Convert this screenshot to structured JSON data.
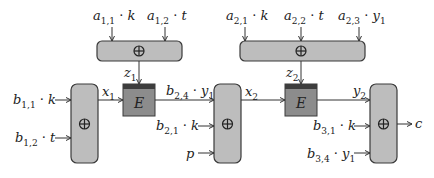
{
  "diagram": {
    "type": "block-diagram",
    "colors": {
      "xor_box": "#bdbdbd",
      "enc_box": "#8c8c8c",
      "enc_top": "#3d3d3d",
      "stroke": "#3a3a3a"
    },
    "top_xor_1": {
      "inputs": [
        {
          "coef": "a",
          "sub": "1,1",
          "var": "k"
        },
        {
          "coef": "a",
          "sub": "1,2",
          "var": "t"
        }
      ],
      "output": {
        "name": "z",
        "sub": "1"
      }
    },
    "top_xor_2": {
      "inputs": [
        {
          "coef": "a",
          "sub": "2,1",
          "var": "k"
        },
        {
          "coef": "a",
          "sub": "2,2",
          "var": "t"
        },
        {
          "coef": "a",
          "sub": "2,3",
          "var": "y",
          "varsub": "1"
        }
      ],
      "output": {
        "name": "z",
        "sub": "2"
      }
    },
    "xor_1": {
      "inputs": [
        {
          "coef": "b",
          "sub": "1,1",
          "var": "k"
        },
        {
          "coef": "b",
          "sub": "1,2",
          "var": "t"
        }
      ],
      "output": {
        "name": "x",
        "sub": "1"
      }
    },
    "enc_1": {
      "label": "E",
      "key": "z1",
      "input": "x1",
      "output_label": {
        "coef": "b",
        "sub": "2,4",
        "var": "y",
        "varsub": "1"
      }
    },
    "xor_2": {
      "inputs": [
        {
          "coef": "b",
          "sub": "2,4",
          "var": "y",
          "varsub": "1"
        },
        {
          "coef": "b",
          "sub": "2,1",
          "var": "k"
        },
        {
          "var": "p"
        }
      ],
      "output": {
        "name": "x",
        "sub": "2"
      }
    },
    "enc_2": {
      "label": "E",
      "key": "z2",
      "input": "x2",
      "output": {
        "name": "y",
        "sub": "2"
      }
    },
    "xor_3": {
      "inputs": [
        {
          "name": "y",
          "sub": "2"
        },
        {
          "coef": "b",
          "sub": "3,1",
          "var": "k"
        },
        {
          "coef": "b",
          "sub": "3,4",
          "var": "y",
          "varsub": "1"
        }
      ],
      "output": {
        "var": "c"
      }
    },
    "symbols": {
      "xor": "⊕",
      "dot": "·"
    }
  }
}
